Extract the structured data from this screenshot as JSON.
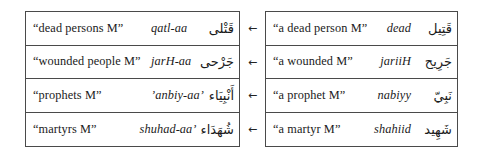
{
  "figure": {
    "arrow_glyph": "←",
    "direction": "right-to-left derivation",
    "border_color": "#4a4a4a",
    "background_color": "#ffffff"
  },
  "plural_table": {
    "name": "plural forms",
    "rows": [
      {
        "gloss": "“dead persons M”",
        "translit": "qatl-aa",
        "arabic": "قَتْلى"
      },
      {
        "gloss": "“wounded people M”",
        "translit": "jarH-aa",
        "arabic": "جَرْحى"
      },
      {
        "gloss": "“prophets M”",
        "translit": "’anbiy-aa’",
        "arabic": "أَنْبِيَاء"
      },
      {
        "gloss": "“martyrs M”",
        "translit": "shuhad-aa’",
        "arabic": "شُهَدَاء"
      }
    ]
  },
  "singular_table": {
    "name": "singular forms",
    "rows": [
      {
        "gloss": "“a dead person M”",
        "translit": "dead",
        "arabic": "قَتِيل"
      },
      {
        "gloss": "“a wounded M”",
        "translit": "jariiH",
        "arabic": "جَرِيح"
      },
      {
        "gloss": "“a prophet M”",
        "translit": "nabiyy",
        "arabic": "نَبِيّ"
      },
      {
        "gloss": "“a martyr M”",
        "translit": "shahiid",
        "arabic": "شَهِيد"
      }
    ]
  },
  "arrows": [
    {
      "glyph": "←"
    },
    {
      "glyph": "←"
    },
    {
      "glyph": "←"
    },
    {
      "glyph": "←"
    }
  ]
}
